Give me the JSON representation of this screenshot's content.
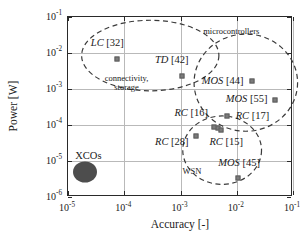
{
  "chart_data": {
    "type": "scatter",
    "title": "",
    "xlabel": "Accuracy [-]",
    "ylabel": "Power [W]",
    "xscale": "log",
    "yscale": "log",
    "xlim": [
      1e-05,
      0.1
    ],
    "ylim": [
      1e-06,
      0.1
    ],
    "grid": true,
    "legend": "none",
    "xticks": [
      {
        "value": 1e-05,
        "mantissa": "10",
        "exponent": "-5"
      },
      {
        "value": 0.0001,
        "mantissa": "10",
        "exponent": "-4"
      },
      {
        "value": 0.001,
        "mantissa": "10",
        "exponent": "-3"
      },
      {
        "value": 0.01,
        "mantissa": "10",
        "exponent": "-2"
      },
      {
        "value": 0.1,
        "mantissa": "10",
        "exponent": "-1"
      }
    ],
    "yticks": [
      {
        "value": 0.1,
        "mantissa": "10",
        "exponent": "-1"
      },
      {
        "value": 0.01,
        "mantissa": "10",
        "exponent": "-2"
      },
      {
        "value": 0.001,
        "mantissa": "10",
        "exponent": "-3"
      },
      {
        "value": 0.0001,
        "mantissa": "10",
        "exponent": "-4"
      },
      {
        "value": 1e-05,
        "mantissa": "10",
        "exponent": "-5"
      },
      {
        "value": 1e-06,
        "mantissa": "10",
        "exponent": "-6"
      }
    ],
    "marker_color": "#7b7b7b",
    "points": [
      {
        "name": "LC [32]",
        "label": "LC",
        "ref": "[32]",
        "x": 7.5e-05,
        "y": 0.007,
        "label_x": 5e-05,
        "label_y": 0.019
      },
      {
        "name": "TD [42]",
        "label": "TD",
        "ref": "[42]",
        "x": 0.00105,
        "y": 0.0023,
        "label_x": 0.0007,
        "label_y": 0.0062
      },
      {
        "name": "MOS [44]",
        "label": "MOS",
        "ref": "[44]",
        "x": 0.019,
        "y": 0.00165,
        "label_x": 0.0056,
        "label_y": 0.00165
      },
      {
        "name": "MOS [55]",
        "label": "MOS",
        "ref": "[55]",
        "x": 0.047,
        "y": 0.0005,
        "label_x": 0.015,
        "label_y": 0.00053
      },
      {
        "name": "RC [17]",
        "label": "RC",
        "ref": "[17]",
        "x": 0.0066,
        "y": 0.000175,
        "label_x": 0.019,
        "label_y": 0.000175
      },
      {
        "name": "RC [16]",
        "label": "RC",
        "ref": "[16]",
        "x": 0.0046,
        "y": 8.5e-05,
        "label_x": 0.00155,
        "label_y": 0.00022
      },
      {
        "name": "RC [16b]",
        "label": "",
        "ref": "",
        "x": 0.004,
        "y": 8.8e-05,
        "label_x": null,
        "label_y": null
      },
      {
        "name": "RC [15]",
        "label": "RC",
        "ref": "[15]",
        "x": 0.0052,
        "y": 7.3e-05,
        "label_x": 0.0065,
        "label_y": 3.4e-05
      },
      {
        "name": "RC [28]",
        "label": "RC",
        "ref": "[28]",
        "x": 0.0019,
        "y": 4.8e-05,
        "label_x": 0.0007,
        "label_y": 3.4e-05
      },
      {
        "name": "MOS [45]",
        "label": "MOS",
        "ref": "[45]",
        "x": 0.0105,
        "y": 3.3e-06,
        "label_x": 0.011,
        "label_y": 9e-06
      }
    ],
    "clusters": [
      {
        "name": "connectivity-storage",
        "label_line1": "connectivity,",
        "label_line2": "storage",
        "label_x": 0.00011,
        "label_y": 0.0015,
        "ellipse": {
          "cx": 0.00029,
          "cy": 0.0085,
          "rx_dec": 1.22,
          "ry_dec": 0.98,
          "rot": 0
        }
      },
      {
        "name": "microcontrollers",
        "label_line1": "microcontrollers",
        "label_line2": "",
        "label_x": 0.008,
        "label_y": 0.042,
        "ellipse": {
          "cx": 0.0145,
          "cy": 0.0015,
          "rx_dec": 0.92,
          "ry_dec": 1.35,
          "rot": 0
        }
      },
      {
        "name": "WSN",
        "label_line1": "WSN",
        "label_line2": "",
        "label_x": 0.0016,
        "label_y": 5.2e-06,
        "ellipse": {
          "cx": 0.0055,
          "cy": 2e-05,
          "rx_dec": 0.7,
          "ry_dec": 0.95,
          "rot": 0
        }
      }
    ],
    "blob": {
      "name": "XCOs",
      "label": "XCOs",
      "x": 2e-05,
      "y": 5e-06,
      "label_x": 2.3e-05,
      "label_y": 1.35e-05,
      "color": "#4d4d4d"
    }
  }
}
